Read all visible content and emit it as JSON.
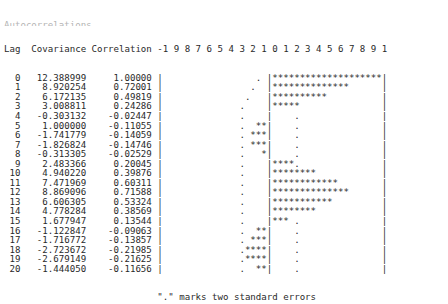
{
  "title_clipped": "Autocorrelations",
  "header": {
    "lag_label": "Lag",
    "covariance_label": "Covariance",
    "correlation_label": "Correlation",
    "axis_ticks": [
      "-1",
      "9",
      "8",
      "7",
      "6",
      "5",
      "4",
      "3",
      "2",
      "1",
      "0",
      "1",
      "2",
      "3",
      "4",
      "5",
      "6",
      "7",
      "8",
      "9",
      "1"
    ],
    "axis_line": "-1 9 8 7 6 5 4 3 2 1 0 1 2 3 4 5 6 7 8 9 1"
  },
  "footnote": "\".\" marks two standard errors",
  "marker_symbol": "*",
  "stderr_symbol": ".",
  "border_symbol": "|",
  "colors": {
    "text": "#2a2a2a",
    "background": "#ffffff"
  },
  "chart_data": {
    "type": "bar",
    "title": "Autocorrelations",
    "xlabel": "Correlation",
    "ylabel": "Lag",
    "xlim": [
      -1,
      1
    ],
    "grid": false,
    "legend": "\".\" marks two standard errors",
    "categories": [
      0,
      1,
      2,
      3,
      4,
      5,
      6,
      7,
      8,
      9,
      10,
      11,
      12,
      13,
      14,
      15,
      16,
      17,
      18,
      19,
      20
    ],
    "series": [
      {
        "name": "Covariance",
        "values": [
          12.388999,
          8.920254,
          6.172135,
          3.008811,
          -0.303132,
          1.0,
          -1.741779,
          -1.826824,
          -0.313305,
          2.483366,
          4.94022,
          7.471969,
          8.869096,
          6.606305,
          4.778284,
          1.677947,
          -1.122847,
          -1.716772,
          -2.723672,
          -2.679149,
          -1.44405
        ]
      },
      {
        "name": "Correlation",
        "values": [
          1.0,
          0.72001,
          0.49819,
          0.24286,
          -0.02447,
          -0.11055,
          -0.14059,
          -0.14746,
          -0.02529,
          0.20045,
          0.39876,
          0.60311,
          0.71588,
          0.53324,
          0.38569,
          0.13544,
          -0.09063,
          -0.13857,
          -0.21985,
          -0.21625,
          -0.11656
        ]
      }
    ],
    "rows": [
      {
        "lag": "0",
        "covariance": "12.388999",
        "correlation": "1.00000",
        "stars": 20,
        "dir": "pos",
        "se_pos": 2
      },
      {
        "lag": "1",
        "covariance": "8.920254",
        "correlation": "0.72001",
        "stars": 14,
        "dir": "pos",
        "se_pos": 3
      },
      {
        "lag": "2",
        "covariance": "6.172135",
        "correlation": "0.49819",
        "stars": 10,
        "dir": "pos",
        "se_pos": 4
      },
      {
        "lag": "3",
        "covariance": "3.008811",
        "correlation": "0.24286",
        "stars": 5,
        "dir": "pos",
        "se_pos": 5
      },
      {
        "lag": "4",
        "covariance": "-0.303132",
        "correlation": "-0.02447",
        "stars": 0,
        "dir": "neg",
        "se_pos": 5
      },
      {
        "lag": "5",
        "covariance": "1.000000",
        "correlation": "-0.11055",
        "stars": 2,
        "dir": "neg",
        "se_pos": 5
      },
      {
        "lag": "6",
        "covariance": "-1.741779",
        "correlation": "-0.14059",
        "stars": 3,
        "dir": "neg",
        "se_pos": 5
      },
      {
        "lag": "7",
        "covariance": "-1.826824",
        "correlation": "-0.14746",
        "stars": 3,
        "dir": "neg",
        "se_pos": 5
      },
      {
        "lag": "8",
        "covariance": "-0.313305",
        "correlation": "-0.02529",
        "stars": 1,
        "dir": "neg",
        "se_pos": 5
      },
      {
        "lag": "9",
        "covariance": "2.483366",
        "correlation": "0.20045",
        "stars": 4,
        "dir": "pos",
        "se_pos": 5
      },
      {
        "lag": "10",
        "covariance": "4.940220",
        "correlation": "0.39876",
        "stars": 8,
        "dir": "pos",
        "se_pos": 5
      },
      {
        "lag": "11",
        "covariance": "7.471969",
        "correlation": "0.60311",
        "stars": 12,
        "dir": "pos",
        "se_pos": 5
      },
      {
        "lag": "12",
        "covariance": "8.869096",
        "correlation": "0.71588",
        "stars": 14,
        "dir": "pos",
        "se_pos": 5
      },
      {
        "lag": "13",
        "covariance": "6.606305",
        "correlation": "0.53324",
        "stars": 11,
        "dir": "pos",
        "se_pos": 5
      },
      {
        "lag": "14",
        "covariance": "4.778284",
        "correlation": "0.38569",
        "stars": 8,
        "dir": "pos",
        "se_pos": 5
      },
      {
        "lag": "15",
        "covariance": "1.677947",
        "correlation": "0.13544",
        "stars": 3,
        "dir": "pos",
        "se_pos": 5
      },
      {
        "lag": "16",
        "covariance": "-1.122847",
        "correlation": "-0.09063",
        "stars": 2,
        "dir": "neg",
        "se_pos": 5
      },
      {
        "lag": "17",
        "covariance": "-1.716772",
        "correlation": "-0.13857",
        "stars": 3,
        "dir": "neg",
        "se_pos": 5
      },
      {
        "lag": "18",
        "covariance": "-2.723672",
        "correlation": "-0.21985",
        "stars": 4,
        "dir": "neg",
        "se_pos": 5
      },
      {
        "lag": "19",
        "covariance": "-2.679149",
        "correlation": "-0.21625",
        "stars": 4,
        "dir": "neg",
        "se_pos": 5
      },
      {
        "lag": "20",
        "covariance": "-1.444050",
        "correlation": "-0.11656",
        "stars": 2,
        "dir": "neg",
        "se_pos": 5
      }
    ]
  }
}
